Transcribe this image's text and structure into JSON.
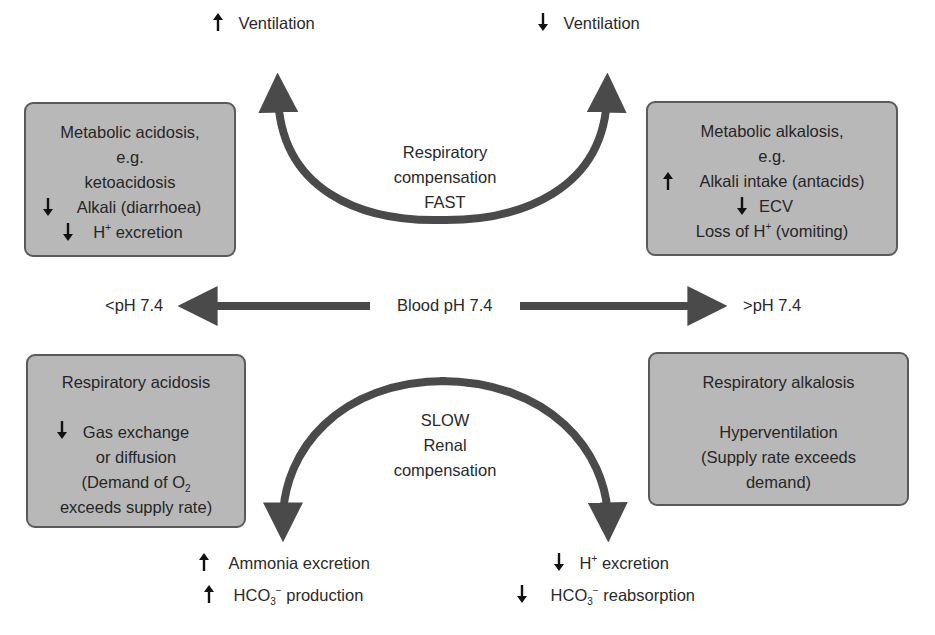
{
  "colors": {
    "box_fill": "#b8b8b8",
    "box_border": "#5a5a5a",
    "arrow": "#4a4a4a",
    "text": "#2a2a2a",
    "background": "#ffffff"
  },
  "top": {
    "left_label": {
      "direction": "up",
      "text": "Ventilation"
    },
    "right_label": {
      "direction": "down",
      "text": "Ventilation"
    },
    "arc_label": [
      "Respiratory",
      "compensation",
      "FAST"
    ]
  },
  "center": {
    "label": "Blood pH 7.4",
    "left": "<pH 7.4",
    "right": ">pH 7.4"
  },
  "boxes": {
    "metabolic_acidosis": {
      "title": "Metabolic acidosis,",
      "eg": "e.g.",
      "line1": "ketoacidosis",
      "line2": {
        "direction": "down",
        "text": "Alkali (diarrhoea)"
      },
      "line3": {
        "direction": "down",
        "prefix": "H",
        "sup": "+",
        "suffix": " excretion"
      }
    },
    "metabolic_alkalosis": {
      "title": "Metabolic alkalosis,",
      "eg": "e.g.",
      "line1": {
        "direction": "up",
        "text": "Alkali intake (antacids)"
      },
      "line2": {
        "direction": "down",
        "text": "ECV"
      },
      "line3": {
        "prefix": "Loss of H",
        "sup": "+",
        "suffix": " (vomiting)"
      }
    },
    "respiratory_acidosis": {
      "title": "Respiratory acidosis",
      "line1": {
        "direction": "down",
        "text": "Gas exchange"
      },
      "line2": "or diffusion",
      "line3": {
        "prefix": "(Demand of O",
        "sub": "2",
        "suffix": ""
      },
      "line4": "exceeds supply rate)"
    },
    "respiratory_alkalosis": {
      "title": "Respiratory alkalosis",
      "line1": "Hyperventilation",
      "line2": "(Supply rate exceeds",
      "line3": "demand)"
    }
  },
  "bottom": {
    "arc_label": [
      "SLOW",
      "Renal",
      "compensation"
    ],
    "left": [
      {
        "direction": "up",
        "text": "Ammonia excretion"
      },
      {
        "direction": "up",
        "prefix": "HCO",
        "sub": "3",
        "sup": "−",
        "suffix": " production"
      }
    ],
    "right": [
      {
        "direction": "down",
        "prefix": "H",
        "sup": "+",
        "suffix": " excretion"
      },
      {
        "direction": "down",
        "prefix": "HCO",
        "sub": "3",
        "sup": "−",
        "suffix": " reabsorption"
      }
    ]
  }
}
